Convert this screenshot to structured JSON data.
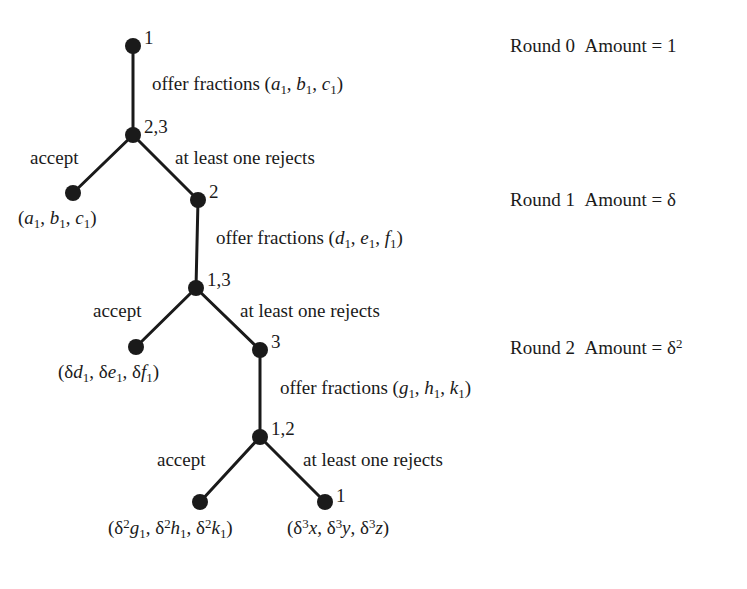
{
  "figure": {
    "type": "game-tree",
    "title": "",
    "background_color": "#ffffff",
    "ink_color": "#1a1a1a"
  },
  "nodes": [
    {
      "id": "n0",
      "label": "1",
      "x": 133,
      "y": 46,
      "kind": "decision",
      "label_dx": 11,
      "label_dy": -20
    },
    {
      "id": "n1",
      "label": "2,3",
      "x": 133,
      "y": 135,
      "kind": "decision",
      "label_dx": 11,
      "label_dy": -20
    },
    {
      "id": "t1",
      "label": "",
      "x": 73,
      "y": 193,
      "kind": "terminal",
      "label_dx": 0,
      "label_dy": 0
    },
    {
      "id": "n2",
      "label": "2",
      "x": 198,
      "y": 200,
      "kind": "decision",
      "label_dx": 11,
      "label_dy": -20
    },
    {
      "id": "n3",
      "label": "1,3",
      "x": 196,
      "y": 288,
      "kind": "decision",
      "label_dx": 11,
      "label_dy": -20
    },
    {
      "id": "t2",
      "label": "",
      "x": 136,
      "y": 347,
      "kind": "terminal",
      "label_dx": 0,
      "label_dy": 0
    },
    {
      "id": "n4",
      "label": "3",
      "x": 260,
      "y": 350,
      "kind": "decision",
      "label_dx": 11,
      "label_dy": -20
    },
    {
      "id": "n5",
      "label": "1,2",
      "x": 260,
      "y": 437,
      "kind": "decision",
      "label_dx": 11,
      "label_dy": -20
    },
    {
      "id": "t3",
      "label": "",
      "x": 200,
      "y": 502,
      "kind": "terminal",
      "label_dx": 0,
      "label_dy": 0
    },
    {
      "id": "t4",
      "label": "1",
      "x": 325,
      "y": 502,
      "kind": "terminal",
      "label_dx": 11,
      "label_dy": -18
    }
  ],
  "edges": [
    {
      "from": "n0",
      "to": "n1"
    },
    {
      "from": "n1",
      "to": "t1"
    },
    {
      "from": "n1",
      "to": "n2"
    },
    {
      "from": "n2",
      "to": "n3"
    },
    {
      "from": "n3",
      "to": "t2"
    },
    {
      "from": "n3",
      "to": "n4"
    },
    {
      "from": "n4",
      "to": "n5"
    },
    {
      "from": "n5",
      "to": "t3"
    },
    {
      "from": "n5",
      "to": "t4"
    }
  ],
  "offers": [
    {
      "id": "offer1",
      "text_plain": "offer fractions (a1, b1, c1)",
      "x": 152,
      "y": 74,
      "vars": [
        "a",
        "b",
        "c"
      ]
    },
    {
      "id": "offer2",
      "text_plain": "offer fractions (d1, e1, f1)",
      "x": 216,
      "y": 228,
      "vars": [
        "d",
        "e",
        "f"
      ]
    },
    {
      "id": "offer3",
      "text_plain": "offer fractions (g1, h1, k1)",
      "x": 280,
      "y": 378,
      "vars": [
        "g",
        "h",
        "k"
      ]
    }
  ],
  "actions": [
    {
      "id": "accept1",
      "label": "accept",
      "x": 30,
      "y": 148
    },
    {
      "id": "reject1",
      "label": "at least one rejects",
      "x": 175,
      "y": 148
    },
    {
      "id": "accept2",
      "label": "accept",
      "x": 93,
      "y": 301
    },
    {
      "id": "reject2",
      "label": "at least one rejects",
      "x": 240,
      "y": 301
    },
    {
      "id": "accept3",
      "label": "accept",
      "x": 157,
      "y": 450
    },
    {
      "id": "reject3",
      "label": "at least one rejects",
      "x": 303,
      "y": 450
    }
  ],
  "payoffs": [
    {
      "id": "payoff1",
      "text_plain": "(a1, b1, c1)",
      "x": 18,
      "y": 208
    },
    {
      "id": "payoff2",
      "text_plain": "(δd1, δe1, δf1)",
      "x": 58,
      "y": 362
    },
    {
      "id": "payoff3",
      "text_plain": "(δ²g1, δ²h1, δ²k1)",
      "x": 108,
      "y": 518
    },
    {
      "id": "payoff4",
      "text_plain": "(δ³x, δ³y, δ³z)",
      "x": 287,
      "y": 518
    }
  ],
  "rounds": [
    {
      "id": "round0",
      "round_label": "Round 0",
      "amount_label": "Amount = 1",
      "amount_base": "1",
      "x": 510,
      "y": 36
    },
    {
      "id": "round1",
      "round_label": "Round 1",
      "amount_label": "Amount = δ",
      "amount_base": "δ",
      "x": 510,
      "y": 190
    },
    {
      "id": "round2",
      "round_label": "Round 2",
      "amount_label": "Amount = δ²",
      "amount_base": "δ",
      "amount_exp": "2",
      "x": 510,
      "y": 338
    }
  ]
}
